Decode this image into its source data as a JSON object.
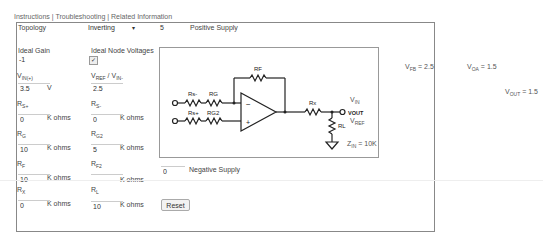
{
  "nav": {
    "links": [
      "Instructions",
      "Troubleshooting",
      "Related Information"
    ],
    "separator": " | "
  },
  "topology": {
    "label": "Topology",
    "selected": "Inverting",
    "caret": "▾"
  },
  "positive_supply": {
    "value": "5",
    "label": "Positive Supply"
  },
  "negative_supply": {
    "value": "0",
    "label": "Negative Supply"
  },
  "ideal_gain": {
    "label": "Ideal Gain",
    "value": "-1"
  },
  "ideal_node_voltages": {
    "label": "Ideal Node Voltages",
    "checked": true,
    "check": "✓"
  },
  "vin_plus": {
    "label": "V",
    "sub": "IN(+)",
    "value": "3.5",
    "unit": "V"
  },
  "vref": {
    "label": "V",
    "sub": "REF",
    "label2": " / V",
    "sub2": "IN-",
    "value": "2.5"
  },
  "rs_plus": {
    "label": "R",
    "sub": "S+",
    "value": "0",
    "unit": "K ohms"
  },
  "rs_minus": {
    "label": "R",
    "sub": "S-",
    "value": "0",
    "unit": "K ohms"
  },
  "rg": {
    "label": "R",
    "sub": "G",
    "value": "10",
    "unit": "K ohms"
  },
  "rg2": {
    "label": "R",
    "sub": "G2",
    "value": "5",
    "unit": "K ohms"
  },
  "rf": {
    "label": "R",
    "sub": "F",
    "value": "10",
    "unit": "K ohms"
  },
  "rf2": {
    "label": "R",
    "sub": "F2",
    "value": "",
    "unit": "K ohms"
  },
  "rx": {
    "label": "R",
    "sub": "X",
    "value": "0",
    "unit": "K ohms"
  },
  "rl": {
    "label": "R",
    "sub": "L",
    "value": "10",
    "unit": "K ohms"
  },
  "reset_label": "Reset",
  "diagram": {
    "labels": {
      "rs_minus": "Rs-",
      "rg": "RG",
      "rs_plus": "Rs+",
      "rg2": "RG2",
      "rf": "RF",
      "rx": "Rx",
      "rl": "RL",
      "vout": "VOUT",
      "minus": "−",
      "plus": "+"
    },
    "vin_label": "V",
    "vin_sub": "IN",
    "vref_label": "V",
    "vref_sub": "REF",
    "zin_label": "Z",
    "zin_sub": "IN",
    "zin_value": " = 10K"
  },
  "results": {
    "vfb": {
      "label": "V",
      "sub": "FB",
      "value": " = 2.5"
    },
    "voa": {
      "label": "V",
      "sub": "OA",
      "value": " = 1.5"
    },
    "vout": {
      "label": "V",
      "sub": "OUT",
      "value": " = 1.5"
    }
  }
}
